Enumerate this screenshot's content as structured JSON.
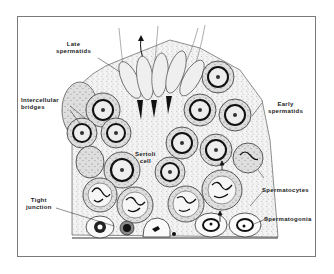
{
  "figure": {
    "labels": {
      "late_spermatids": "Late\nspermatids",
      "intercellular_bridges": "Intercellular\nbridges",
      "sertoli_cell": "Sertoli\ncell",
      "tight_junction": "Tight\njunction",
      "early_spermatids": "Early\nspermatids",
      "spermatocytes": "Spermatocytes",
      "spermatogonia": "Spermatogonia"
    },
    "colors": {
      "ink": "#1a1a1a",
      "cytoplasm": "#c8c8c8",
      "light_fill": "#e6e6e6",
      "frame": "#7a7a7a"
    }
  }
}
